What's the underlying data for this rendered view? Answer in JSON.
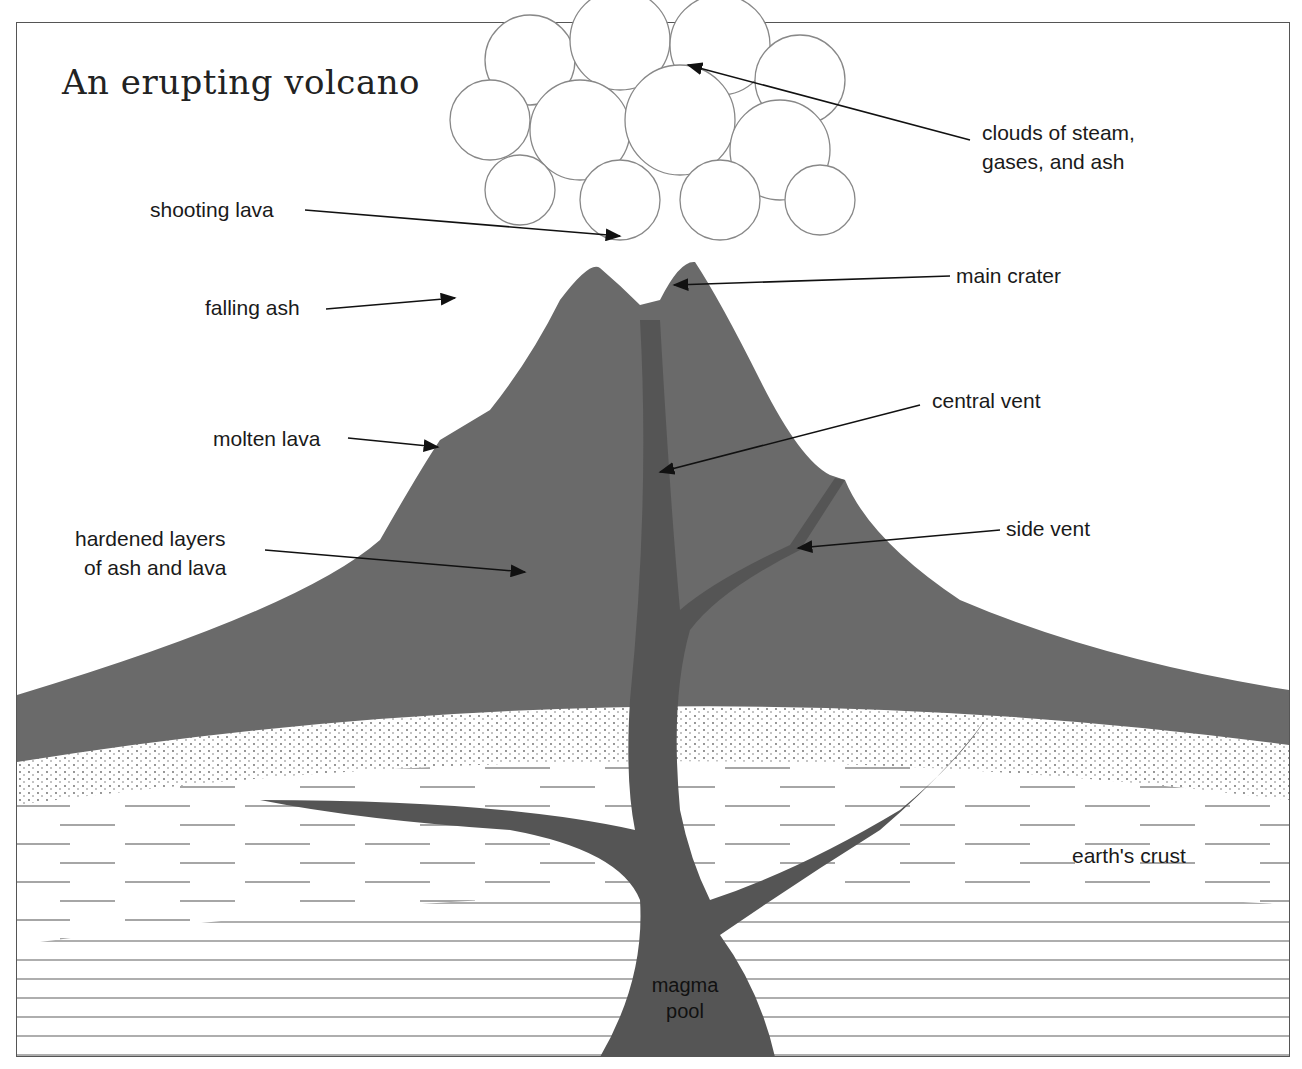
{
  "title": "An erupting volcano",
  "colors": {
    "volcano": "#6a6a6a",
    "outline": "#222222",
    "background": "#ffffff"
  },
  "labels": {
    "clouds": [
      "clouds of steam,",
      "gases, and ash"
    ],
    "shooting_lava": "shooting lava",
    "main_crater": "main crater",
    "falling_ash": "falling ash",
    "central_vent": "central vent",
    "molten_lava": "molten lava",
    "hardened_layers": [
      "hardened layers",
      "of ash and lava"
    ],
    "side_vent": "side vent",
    "earths_crust": "earth's crust",
    "magma_pool": [
      "magma",
      "pool"
    ]
  }
}
